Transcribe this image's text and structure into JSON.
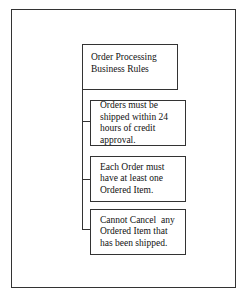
{
  "diagram": {
    "title": "Order Processing Business Rules",
    "title_lines": [
      "Order Processing",
      "Business Rules"
    ],
    "rules": [
      {
        "text": "Orders must be shipped within 24 hours of credit approval."
      },
      {
        "text": "Each Order must have at least one Ordered Item."
      },
      {
        "text": "Cannot Cancel  any Ordered Item that has been shipped."
      }
    ]
  }
}
